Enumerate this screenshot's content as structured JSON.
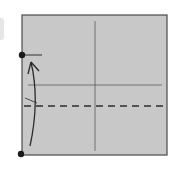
{
  "diagram": {
    "type": "origami-fold-step",
    "colors": {
      "paper": "#c8c8c8",
      "edge": "#4a4a4a",
      "crease": "#5a5a5a",
      "fold_line": "#2e2e2e",
      "arrow": "#2a2a2a",
      "dot": "#1a1a1a"
    },
    "square": {
      "x": 22,
      "y": 15,
      "width": 145,
      "height": 140
    },
    "vertical_crease_x": 95,
    "horizontal_crease_y": 85,
    "valley_fold_y": 106,
    "points": [
      {
        "name": "top-reference-point",
        "x": 22,
        "y": 55
      },
      {
        "name": "bottom-left-corner-point",
        "x": 21,
        "y": 154
      }
    ]
  }
}
